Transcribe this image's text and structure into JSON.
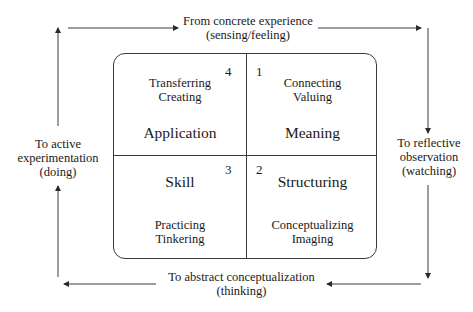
{
  "diagram": {
    "cycle": {
      "top": {
        "line1": "From concrete experience",
        "line2": "(sensing/feeling)"
      },
      "right": {
        "line1": "To reflective",
        "line2": "observation",
        "line3": "(watching)"
      },
      "bottom": {
        "line1": "To abstract conceptualization",
        "line2": "(thinking)"
      },
      "left": {
        "line1": "To active",
        "line2": "experimentation",
        "line3": "(doing)"
      }
    },
    "quadrants": {
      "top_left": {
        "number": "4",
        "verb1": "Transferring",
        "verb2": "Creating",
        "title": "Application"
      },
      "top_right": {
        "number": "1",
        "verb1": "Connecting",
        "verb2": "Valuing",
        "title": "Meaning"
      },
      "bottom_left": {
        "number": "3",
        "title": "Skill",
        "verb1": "Practicing",
        "verb2": "Tinkering"
      },
      "bottom_right": {
        "number": "2",
        "title": "Structuring",
        "verb1": "Conceptualizing",
        "verb2": "Imaging"
      }
    },
    "colors": {
      "line": "#3a3a3a",
      "text": "#1a1a1a",
      "background": "#ffffff"
    }
  }
}
